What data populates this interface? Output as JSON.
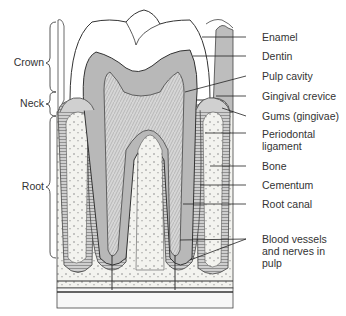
{
  "figure": {
    "colors": {
      "dentin": "#b8b8b8",
      "enamel": "#ffffff",
      "bone": "#f2f2ee",
      "outline": "#333333",
      "pulp": "#d4d4d4"
    }
  },
  "regions": [
    {
      "label": "Crown"
    },
    {
      "label": "Neck"
    },
    {
      "label": "Root"
    }
  ],
  "labels": [
    {
      "text": "Enamel"
    },
    {
      "text": "Dentin"
    },
    {
      "text": "Pulp cavity"
    },
    {
      "text": "Gingival crevice"
    },
    {
      "text": "Gums (gingivae)"
    },
    {
      "text": "Periodontal ligament"
    },
    {
      "text": "Bone"
    },
    {
      "text": "Cementum"
    },
    {
      "text": "Root canal"
    },
    {
      "text": "Blood vessels and nerves in pulp"
    }
  ]
}
